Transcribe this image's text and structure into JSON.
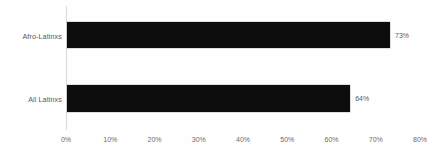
{
  "chart_data": {
    "type": "bar",
    "orientation": "horizontal",
    "title": "",
    "xlabel": "",
    "ylabel": "",
    "categories": [
      "Afro-Latinxs",
      "All Latinxs"
    ],
    "values": [
      73,
      64
    ],
    "value_labels": [
      "73%",
      "64%"
    ],
    "xlim": [
      0,
      80
    ],
    "xticks": [
      0,
      10,
      20,
      30,
      40,
      50,
      60,
      70,
      80
    ],
    "xtick_labels": [
      "0%",
      "10%",
      "20%",
      "30%",
      "40%",
      "50%",
      "60%",
      "70%",
      "80%"
    ],
    "grid": false,
    "legend": null,
    "series": [
      {
        "name": "",
        "values": [
          73,
          64
        ],
        "color": "#0d0d0d"
      }
    ]
  },
  "style": {
    "background": "#fefefe",
    "bar_color": "#0d0d0d",
    "bar_border_color": "#bfbfbf",
    "axis_color": "#d9d9d9",
    "label_color": "#5a5a5a",
    "tick_color": "#6b6b6b"
  }
}
